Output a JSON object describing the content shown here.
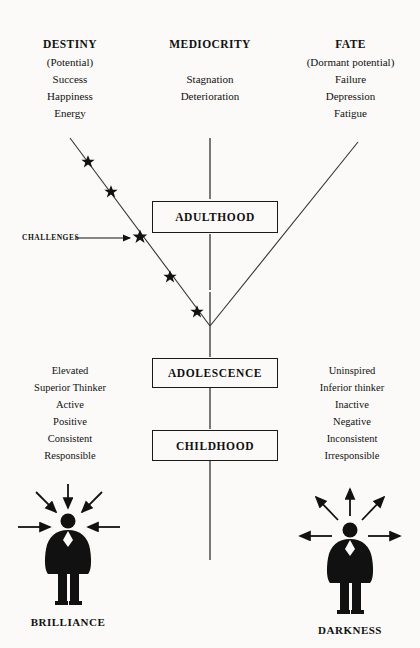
{
  "columns": {
    "left": {
      "heading": "DESTINY",
      "subtitle": "(Potential)",
      "items": [
        "Success",
        "Happiness",
        "Energy"
      ]
    },
    "center": {
      "heading": "MEDIOCRITY",
      "subtitle": "",
      "items": [
        "Stagnation",
        "Deterioration"
      ]
    },
    "right": {
      "heading": "FATE",
      "subtitle": "(Dormant potential)",
      "items": [
        "Failure",
        "Depression",
        "Fatigue"
      ]
    }
  },
  "stage_boxes": [
    {
      "label": "ADULTHOOD"
    },
    {
      "label": "ADOLESCENCE"
    },
    {
      "label": "CHILDHOOD"
    }
  ],
  "annotation": {
    "challenges_label": "CHALLENGES"
  },
  "traits": {
    "left": [
      "Elevated",
      "Superior Thinker",
      "Active",
      "Positive",
      "Consistent",
      "Responsible"
    ],
    "right": [
      "Uninspired",
      "Inferior thinker",
      "Inactive",
      "Negative",
      "Inconsistent",
      "Irresponsible"
    ]
  },
  "outcomes": {
    "left": {
      "label": "BRILLIANCE",
      "arrow_direction": "inward",
      "arrow_count": 5
    },
    "right": {
      "label": "DARKNESS",
      "arrow_direction": "outward",
      "arrow_count": 5
    }
  },
  "markers": {
    "star_count": 5,
    "star_glyph": "star"
  },
  "colors": {
    "ink": "#111111",
    "line": "#333333",
    "paper": "#fbfaf8"
  }
}
